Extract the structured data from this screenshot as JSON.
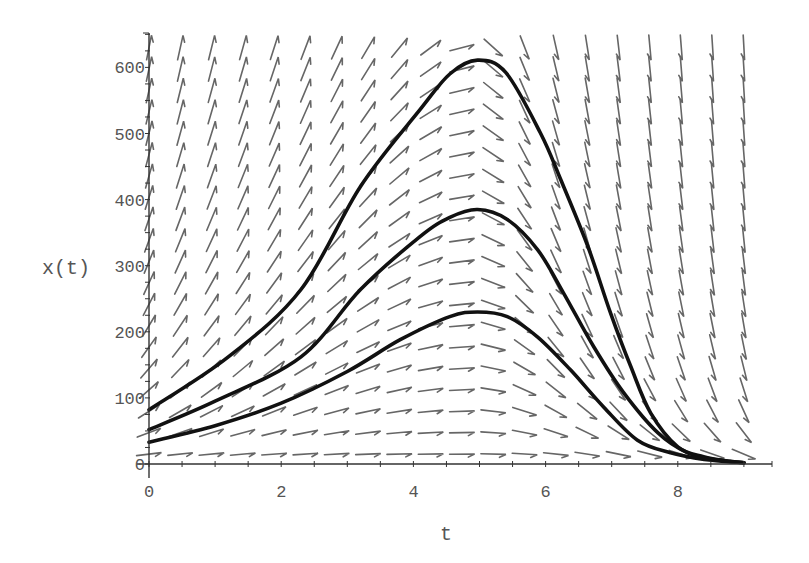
{
  "chart_data": {
    "type": "line",
    "title": "",
    "xlabel": "t",
    "ylabel": "x(t)",
    "xlim": [
      0,
      9.4
    ],
    "ylim": [
      0,
      650
    ],
    "grid": false,
    "legend": null,
    "x_ticks": [
      "0",
      "2",
      "4",
      "6",
      "8"
    ],
    "x_tick_values": [
      0,
      2,
      4,
      6,
      8
    ],
    "y_ticks": [
      "0",
      "100",
      "200",
      "300",
      "400",
      "500",
      "600"
    ],
    "y_tick_values": [
      0,
      100,
      200,
      300,
      400,
      500,
      600
    ],
    "overlay": "direction-field (slope arrows) on 20x20 grid, t in [0, 9.1], x in [15, 630]",
    "series": [
      {
        "name": "solution-upper",
        "x": [
          0,
          1.2,
          2.3,
          3.2,
          4.1,
          4.55,
          4.97,
          5.4,
          5.92,
          6.23,
          6.64,
          6.98,
          7.29,
          7.59,
          8.0,
          8.39,
          8.8,
          9.0
        ],
        "values": [
          82,
          162,
          264,
          420,
          536,
          590,
          611,
          592,
          501,
          430,
          329,
          229,
          147,
          77,
          26,
          11,
          4,
          2
        ]
      },
      {
        "name": "solution-middle",
        "x": [
          0,
          1.0,
          2.3,
          3.2,
          4.1,
          4.55,
          4.97,
          5.42,
          5.88,
          6.27,
          6.73,
          7.18,
          7.7,
          8.15,
          8.6,
          9.0
        ],
        "values": [
          52,
          95,
          162,
          264,
          344,
          373,
          385,
          370,
          324,
          259,
          177,
          108,
          47,
          17,
          6,
          2
        ]
      },
      {
        "name": "solution-lower",
        "x": [
          0,
          1.0,
          2.0,
          3.0,
          3.8,
          4.55,
          4.97,
          5.42,
          5.88,
          6.38,
          6.88,
          7.39,
          7.89,
          8.4,
          9.0
        ],
        "values": [
          33,
          58,
          92,
          140,
          188,
          223,
          230,
          223,
          192,
          142,
          86,
          36,
          17,
          7,
          2
        ]
      }
    ]
  },
  "axes": {
    "x_label": "t",
    "y_label": "x(t)"
  }
}
